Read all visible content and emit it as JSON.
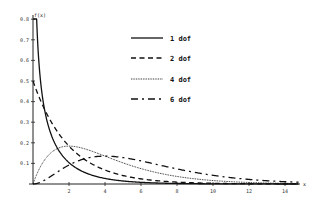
{
  "chart_data": {
    "type": "line",
    "title": "",
    "xlabel": "x",
    "ylabel": "f(x)",
    "xlim": [
      0,
      15
    ],
    "ylim": [
      0,
      0.8
    ],
    "grid": false,
    "legend_position": "upper-center",
    "x_ticks": [
      2,
      4,
      6,
      8,
      10,
      12,
      14
    ],
    "y_ticks": [
      0.1,
      0.2,
      0.3,
      0.4,
      0.5,
      0.6,
      0.7,
      0.8
    ],
    "y_tick_labels": [
      "0.1",
      "0.2",
      "0.3",
      "0.4",
      "0.5",
      "0.6",
      "0.7",
      "0.8"
    ],
    "x_tick_labels": [
      "2",
      "4",
      "6",
      "8",
      "10",
      "12",
      "14"
    ],
    "series": [
      {
        "name": "1 dof",
        "dof": 1,
        "style": "solid",
        "x": [
          0.05,
          0.1,
          0.2,
          0.3,
          0.5,
          0.75,
          1,
          1.5,
          2,
          3,
          4,
          5,
          6,
          8,
          10,
          12,
          14
        ],
        "values": [
          1.75,
          1.2,
          0.81,
          0.63,
          0.44,
          0.33,
          0.24,
          0.14,
          0.1,
          0.05,
          0.03,
          0.015,
          0.008,
          0.002,
          0.001,
          0.0,
          0.0
        ]
      },
      {
        "name": "2 dof",
        "dof": 2,
        "style": "dashed",
        "x": [
          0,
          1,
          2,
          3,
          4,
          5,
          6,
          8,
          10,
          12,
          14
        ],
        "values": [
          0.5,
          0.3,
          0.18,
          0.11,
          0.07,
          0.04,
          0.025,
          0.009,
          0.003,
          0.001,
          0.0
        ]
      },
      {
        "name": "4 dof",
        "dof": 4,
        "style": "dotted",
        "x": [
          0,
          1,
          2,
          3,
          4,
          5,
          6,
          8,
          10,
          12,
          14
        ],
        "values": [
          0.0,
          0.15,
          0.18,
          0.17,
          0.135,
          0.1,
          0.075,
          0.037,
          0.017,
          0.007,
          0.003
        ]
      },
      {
        "name": "6 dof",
        "dof": 6,
        "style": "dash-dot",
        "x": [
          0,
          1,
          2,
          3,
          4,
          5,
          6,
          8,
          10,
          12,
          14
        ],
        "values": [
          0.0,
          0.038,
          0.092,
          0.126,
          0.135,
          0.128,
          0.112,
          0.073,
          0.042,
          0.022,
          0.011
        ]
      }
    ]
  },
  "axes": {
    "y_label": "f(x)",
    "x_label": "x"
  },
  "legend": [
    {
      "label": "1 dof",
      "style": "solid"
    },
    {
      "label": "2 dof",
      "style": "dashed"
    },
    {
      "label": "4 dof",
      "style": "dotted"
    },
    {
      "label": "6 dof",
      "style": "dash-dot"
    }
  ],
  "colors": {
    "line": "#111111",
    "axis": "#222222",
    "background": "#ffffff"
  }
}
